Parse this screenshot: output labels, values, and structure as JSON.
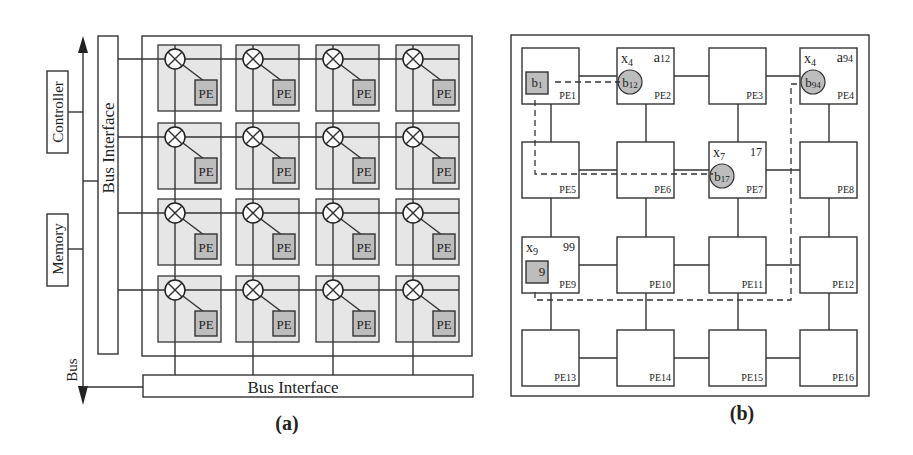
{
  "panel_a": {
    "caption": "(a)",
    "controller_label": "Controller",
    "memory_label": "Memory",
    "bus_label": "Bus",
    "bus_interface_vertical": "Bus Interface",
    "bus_interface_horizontal": "Bus Interface",
    "pe_label": "PE",
    "grid_rows": 4,
    "grid_cols": 4
  },
  "panel_b": {
    "caption": "(b)",
    "nodes": [
      {
        "id": "PE1",
        "x_label": "",
        "a_label": "",
        "item": "b1",
        "item_shape": "square"
      },
      {
        "id": "PE2",
        "x_label": "x4",
        "a_label": "a12",
        "item": "b12",
        "item_shape": "circle"
      },
      {
        "id": "PE3",
        "x_label": "",
        "a_label": "",
        "item": "",
        "item_shape": ""
      },
      {
        "id": "PE4",
        "x_label": "x4",
        "a_label": "a94",
        "item": "b94",
        "item_shape": "circle"
      },
      {
        "id": "PE5",
        "x_label": "",
        "a_label": "",
        "item": "",
        "item_shape": ""
      },
      {
        "id": "PE6",
        "x_label": "",
        "a_label": "",
        "item": "",
        "item_shape": ""
      },
      {
        "id": "PE7",
        "x_label": "x7",
        "a_label": "17",
        "item": "b17",
        "item_shape": "circle"
      },
      {
        "id": "PE8",
        "x_label": "",
        "a_label": "",
        "item": "",
        "item_shape": ""
      },
      {
        "id": "PE9",
        "x_label": "x9",
        "a_label": "99",
        "item": "9",
        "item_shape": "square"
      },
      {
        "id": "PE10",
        "x_label": "",
        "a_label": "",
        "item": "",
        "item_shape": ""
      },
      {
        "id": "PE11",
        "x_label": "",
        "a_label": "",
        "item": "",
        "item_shape": ""
      },
      {
        "id": "PE12",
        "x_label": "",
        "a_label": "",
        "item": "",
        "item_shape": ""
      },
      {
        "id": "PE13",
        "x_label": "",
        "a_label": "",
        "item": "",
        "item_shape": ""
      },
      {
        "id": "PE14",
        "x_label": "",
        "a_label": "",
        "item": "",
        "item_shape": ""
      },
      {
        "id": "PE15",
        "x_label": "",
        "a_label": "",
        "item": "",
        "item_shape": ""
      },
      {
        "id": "PE16",
        "x_label": "",
        "a_label": "",
        "item": "",
        "item_shape": ""
      }
    ]
  }
}
